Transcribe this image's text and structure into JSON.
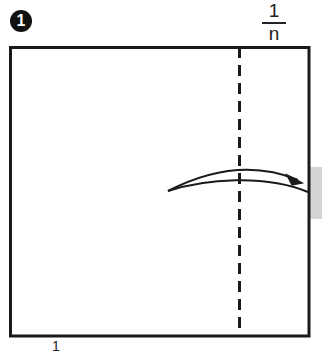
{
  "step": {
    "number": "1"
  },
  "fraction_label": {
    "numerator": "1",
    "denominator": "n"
  },
  "bottom_label": "1",
  "colors": {
    "line": "#1a1a1a",
    "tab_fill": "#d4d4d4",
    "background": "#ffffff"
  },
  "diagram": {
    "square": {
      "x": 10,
      "y": 47,
      "width": 299,
      "height": 289
    },
    "fold_line": {
      "x": 239,
      "style": "dashed"
    },
    "tab": {
      "x": 309,
      "y": 167,
      "width": 13,
      "height": 52
    },
    "arrow": {
      "direction": "right",
      "meaning": "fold right strip over"
    }
  }
}
